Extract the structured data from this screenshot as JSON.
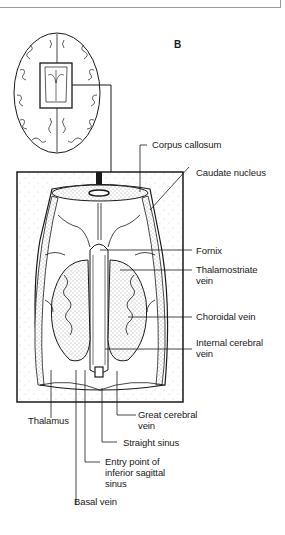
{
  "figure": {
    "panel_letter": "B",
    "overview": "Axial brain outline with inset box indicating region of enlarged view",
    "labels": {
      "corpus_callosum": "Corpus callosum",
      "caudate_nucleus": "Caudate nucleus",
      "fornix": "Fornix",
      "thalamostriate_vein_1": "Thalamostriate",
      "thalamostriate_vein_2": "vein",
      "choroidal_vein": "Choroidal vein",
      "internal_cerebral_vein_1": "Internal cerebral",
      "internal_cerebral_vein_2": "vein",
      "thalamus": "Thalamus",
      "great_cerebral_vein_1": "Great cerebral",
      "great_cerebral_vein_2": "vein",
      "straight_sinus": "Straight sinus",
      "entry_point_1": "Entry point of",
      "entry_point_2": "inferior sagittal",
      "entry_point_3": "sinus",
      "basal_vein": "Basal vein"
    }
  }
}
